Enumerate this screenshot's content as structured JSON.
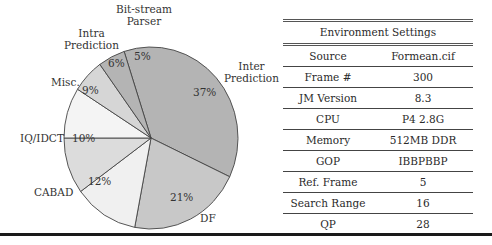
{
  "chart_data": {
    "type": "pie",
    "title": "",
    "slices": [
      {
        "label": "Inter Prediction",
        "value": 37,
        "pct_label": "37%",
        "color": "#b4b4b4"
      },
      {
        "label": "DF",
        "value": 21,
        "pct_label": "21%",
        "color": "#c8c8c8"
      },
      {
        "label": "CABAD",
        "value": 12,
        "pct_label": "12%",
        "color": "#f0f0f0"
      },
      {
        "label": "IQ/IDCT",
        "value": 10,
        "pct_label": "10%",
        "color": "#dcdcdc"
      },
      {
        "label": "Misc.",
        "value": 9,
        "pct_label": "9%",
        "color": "#f4f4f4"
      },
      {
        "label": "Intra Prediction",
        "value": 6,
        "pct_label": "6%",
        "color": "#d6d6d6"
      },
      {
        "label": "Bit-stream Parser",
        "value": 5,
        "pct_label": "5%",
        "color": "#b4b4b4"
      }
    ],
    "order": "clockwise"
  },
  "labels": {
    "bitstream_line1": "Bit-stream",
    "bitstream_line2": "Parser",
    "intra_line1": "Intra",
    "intra_line2": "Prediction",
    "inter_line1": "Inter",
    "inter_line2": "Prediction",
    "misc": "Misc.",
    "iqidct": "IQ/IDCT",
    "cabad": "CABAD",
    "df": "DF"
  },
  "table": {
    "title": "Environment Settings",
    "rows": [
      {
        "key": "Source",
        "value": "Formean.cif"
      },
      {
        "key": "Frame #",
        "value": "300"
      },
      {
        "key": "JM Version",
        "value": "8.3"
      },
      {
        "key": "CPU",
        "value": "P4 2.8G"
      },
      {
        "key": "Memory",
        "value": "512MB DDR"
      },
      {
        "key": "GOP",
        "value": "IBBPBBP"
      },
      {
        "key": "Ref. Frame",
        "value": "5"
      },
      {
        "key": "Search Range",
        "value": "16"
      },
      {
        "key": "QP",
        "value": "28"
      }
    ]
  }
}
